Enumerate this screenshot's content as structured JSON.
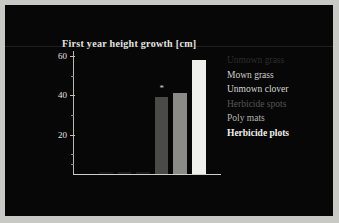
{
  "figure": {
    "title": "First year height growth [cm]",
    "background_color": "#070707",
    "frame_color": "#c8c8c4"
  },
  "axis": {
    "y_ticks": [
      "60",
      "40",
      "20"
    ],
    "y_tick_values": [
      60,
      40,
      20
    ],
    "y_minor_count": 5
  },
  "legend": {
    "items": [
      {
        "label": "Unmown grass",
        "color": "#2d2d2d"
      },
      {
        "label": "Mown grass",
        "color": "#cfcfcb"
      },
      {
        "label": "Unmown clover",
        "color": "#d8d8d4"
      },
      {
        "label": "Herbicide spots",
        "color": "#565653"
      },
      {
        "label": "Poly mats",
        "color": "#b4b4b0"
      },
      {
        "label": "Herbicide plots",
        "color": "#f2f2ee"
      }
    ]
  },
  "annotation": {
    "significance_marker": "*"
  },
  "chart_data": {
    "type": "bar",
    "title": "First year height growth [cm]",
    "xlabel": "",
    "ylabel": "First year height growth [cm]",
    "ylim": [
      0,
      62
    ],
    "grid": false,
    "legend_position": "right",
    "categories": [
      "Unmown grass",
      "Mown grass",
      "Unmown clover",
      "Herbicide spots",
      "Poly mats",
      "Herbicide plots"
    ],
    "values": [
      0.8,
      1.2,
      1.0,
      39,
      41,
      58
    ],
    "bar_colors": [
      "#151515",
      "#1d1d1d",
      "#191919",
      "#4a4a48",
      "#8a8a87",
      "#efefeb"
    ],
    "annotations": [
      {
        "category": "Herbicide spots",
        "text": "*"
      }
    ]
  }
}
